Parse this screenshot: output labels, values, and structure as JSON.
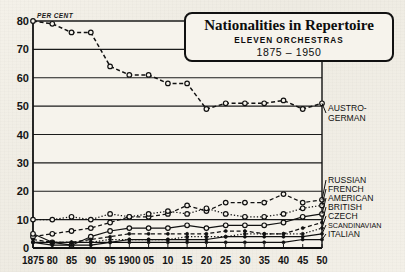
{
  "chart_data": {
    "type": "line",
    "title": "Nationalities in Repertoire",
    "subtitle": "ELEVEN  ORCHESTRAS",
    "subtitle2": "1875 – 1950",
    "ylabel": "PER CENT",
    "xlabel": "",
    "ylim": [
      0,
      80
    ],
    "xlim": [
      1875,
      1950
    ],
    "grid": true,
    "legend_position": "right-of-plot",
    "yticks": [
      0,
      10,
      20,
      30,
      40,
      50,
      60,
      70,
      80
    ],
    "ytick_labels": [
      "0",
      "10",
      "20",
      "30",
      "40",
      "50",
      "60",
      "70",
      "80"
    ],
    "xticks": [
      1875,
      1880,
      1885,
      1890,
      1895,
      1900,
      1905,
      1910,
      1915,
      1920,
      1925,
      1930,
      1935,
      1940,
      1945,
      1950
    ],
    "xtick_labels": [
      "1875",
      "80",
      "85",
      "90",
      "95",
      "1900",
      "05",
      "10",
      "15",
      "20",
      "25",
      "30",
      "35",
      "40",
      "45",
      "50"
    ],
    "x": [
      1875,
      1880,
      1885,
      1890,
      1895,
      1900,
      1905,
      1910,
      1915,
      1920,
      1925,
      1930,
      1935,
      1940,
      1945,
      1950
    ],
    "series": [
      {
        "name": "AUSTRO-GERMAN",
        "style": "dashed",
        "marker": "circle-open",
        "values": [
          80,
          79,
          76,
          76,
          64,
          61,
          61,
          58,
          58,
          49,
          51,
          51,
          51,
          52,
          49,
          51
        ]
      },
      {
        "name": "RUSSIAN",
        "style": "dashed",
        "marker": "circle-open",
        "values": [
          4,
          5,
          6,
          7,
          9,
          11,
          11,
          12,
          15,
          13,
          16,
          16,
          16,
          19,
          16,
          17
        ]
      },
      {
        "name": "FRENCH",
        "style": "dotted",
        "marker": "circle-open",
        "values": [
          10,
          10,
          11,
          10,
          12,
          11,
          12,
          13,
          12,
          14,
          12,
          11,
          11,
          12,
          14,
          15
        ]
      },
      {
        "name": "AMERICAN",
        "style": "solid",
        "marker": "circle-open",
        "values": [
          5,
          2,
          1,
          4,
          6,
          7,
          7,
          7,
          8,
          7,
          8,
          8,
          8,
          9,
          11,
          12
        ]
      },
      {
        "name": "BRITISH",
        "style": "dashed",
        "marker": "dot",
        "values": [
          3,
          2,
          2,
          3,
          4,
          5,
          5,
          5,
          5,
          5,
          6,
          6,
          5,
          5,
          7,
          9
        ]
      },
      {
        "name": "CZECH",
        "style": "dotted",
        "marker": "dot",
        "values": [
          2,
          2,
          2,
          2,
          3,
          3,
          3,
          3,
          4,
          4,
          4,
          5,
          5,
          5,
          5,
          7
        ]
      },
      {
        "name": "SCANDINAVIAN",
        "style": "solid",
        "marker": "dot",
        "values": [
          2,
          2,
          2,
          2,
          2,
          3,
          3,
          3,
          3,
          3,
          4,
          4,
          4,
          4,
          4,
          5
        ]
      },
      {
        "name": "ITALIAN",
        "style": "solid",
        "marker": "dot",
        "values": [
          2,
          1,
          1,
          1,
          2,
          2,
          2,
          2,
          2,
          2,
          2,
          2,
          2,
          2,
          3,
          3
        ]
      }
    ],
    "right_labels": [
      {
        "text": "AUSTRO-",
        "size": "lg"
      },
      {
        "text": "GERMAN",
        "size": "lg"
      },
      {
        "text": "RUSSIAN",
        "size": "lg"
      },
      {
        "text": "FRENCH",
        "size": "lg"
      },
      {
        "text": "AMERICAN",
        "size": "lg"
      },
      {
        "text": "BRITISH",
        "size": "lg"
      },
      {
        "text": "CZECH",
        "size": "lg"
      },
      {
        "text": "SCANDINAVIAN",
        "size": "sm"
      },
      {
        "text": "ITALIAN",
        "size": "lg"
      }
    ]
  }
}
